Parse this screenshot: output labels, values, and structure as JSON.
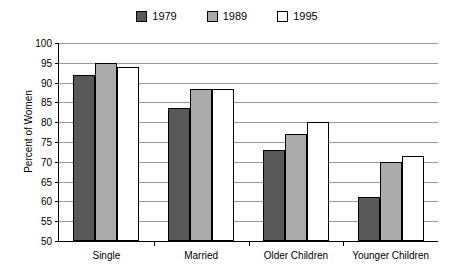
{
  "chart_data": {
    "type": "bar",
    "title": "",
    "xlabel": "",
    "ylabel": "Percent of Women",
    "ylim": [
      50,
      100
    ],
    "ytick_step": 5,
    "yticks": [
      100,
      95,
      90,
      85,
      80,
      75,
      70,
      65,
      60,
      55,
      50
    ],
    "grid": true,
    "legend_position": "top-center",
    "categories": [
      "Single",
      "Married",
      "Older Children",
      "Younger Children"
    ],
    "series": [
      {
        "name": "1979",
        "color": "#595959",
        "values": [
          92,
          83.5,
          73,
          61
        ]
      },
      {
        "name": "1989",
        "color": "#ababab",
        "values": [
          95,
          88.5,
          77,
          70
        ]
      },
      {
        "name": "1995",
        "color": "#ffffff",
        "values": [
          94,
          88.5,
          80,
          71.5
        ]
      }
    ]
  },
  "legend": {
    "entries": [
      {
        "label": "1979"
      },
      {
        "label": "1989"
      },
      {
        "label": "1995"
      }
    ]
  },
  "axes": {
    "y_title": "Percent of Women"
  }
}
